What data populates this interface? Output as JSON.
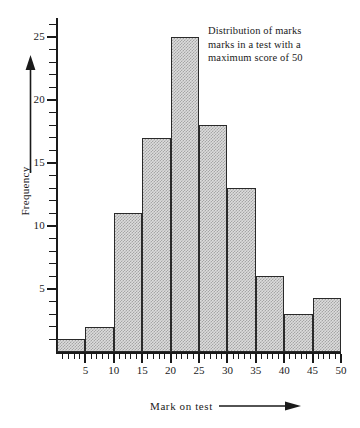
{
  "chart_data": {
    "type": "bar",
    "title": "",
    "subtitle": "",
    "xlabel": "Mark on test",
    "ylabel": "Frequency",
    "xlim": [
      0,
      50
    ],
    "ylim": [
      0,
      26
    ],
    "grid": false,
    "legend": null,
    "bin_width": 5,
    "bin_edges": [
      0,
      5,
      10,
      15,
      20,
      25,
      30,
      35,
      40,
      45,
      50
    ],
    "categories": [
      "0-5",
      "5-10",
      "10-15",
      "15-20",
      "20-25",
      "25-30",
      "30-35",
      "35-40",
      "40-45",
      "45-50"
    ],
    "values": [
      1,
      2,
      11,
      17,
      25,
      18,
      13,
      6,
      3,
      4.3
    ],
    "x_ticks": [
      5,
      10,
      15,
      20,
      25,
      30,
      35,
      40,
      45,
      50
    ],
    "y_ticks": [
      5,
      10,
      15,
      20,
      25
    ],
    "y_minor_tick_step": 1,
    "x_minor_tick_step": 1,
    "annotations": [
      "Distribution of marks",
      "marks in a test with a",
      "maximum score of 50"
    ],
    "colors": {
      "bar_fill": "#dcdcdc",
      "bar_stroke": "#2a2a2a",
      "axis": "#1a1a1a",
      "text": "#1a1a1a",
      "background": "#ffffff"
    }
  },
  "axes": {
    "y_title": "Frequency",
    "x_title": "Mark on test",
    "y_tick_labels": [
      "5",
      "10",
      "15",
      "20",
      "25"
    ],
    "x_tick_labels": [
      "5",
      "10",
      "15",
      "20",
      "25",
      "30",
      "35",
      "40",
      "45",
      "50"
    ]
  },
  "icons": {
    "y_arrow": "arrow-up-icon",
    "x_arrow": "arrow-right-icon"
  }
}
